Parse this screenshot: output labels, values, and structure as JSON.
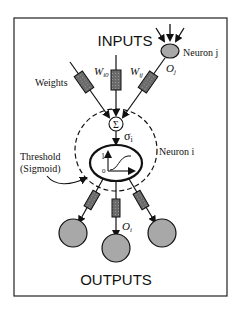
{
  "diagram": {
    "title_inputs": "INPUTS",
    "title_outputs": "OUTPUTS",
    "labels": {
      "neuron_j": "Neuron j",
      "neuron_i": "Neuron i",
      "weights": "Weights",
      "w_i0": "W",
      "w_i0_sub": "i0",
      "w_ij": "W",
      "w_ij_sub": "ij",
      "o_j": "O",
      "o_j_sub": "j",
      "o_i": "O",
      "o_i_sub": "i",
      "sigma_i": "σ",
      "sigma_i_sub": "i",
      "sum_symbol": "Σ",
      "threshold_line1": "Threshold",
      "threshold_line2": "(Sigmoid)",
      "axis_one": "1",
      "axis_zero": "0"
    },
    "colors": {
      "node_fill": "#a8a8a8",
      "weight_fill": "#6a6a6a",
      "line": "#111111"
    }
  }
}
